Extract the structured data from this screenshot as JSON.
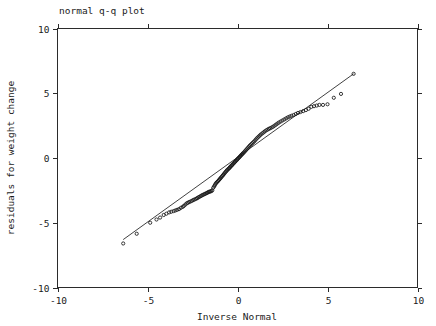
{
  "chart_data": {
    "type": "scatter",
    "title": "normal q-q plot",
    "xlabel": "Inverse Normal",
    "ylabel": "residuals for weight change",
    "xlim": [
      -10,
      10
    ],
    "ylim": [
      -10,
      10
    ],
    "xticks": [
      -10,
      -5,
      0,
      5,
      10
    ],
    "yticks": [
      -10,
      -5,
      0,
      5,
      10
    ],
    "xtick_labels": [
      "-10",
      "-5",
      "0",
      "5",
      "10"
    ],
    "ytick_labels": [
      "-10",
      "-5",
      "0",
      "5",
      "10"
    ],
    "grid": false,
    "legend": "none",
    "marker": "open-circle",
    "series": [
      {
        "name": "reference-line",
        "type": "line",
        "x": [
          -6.35,
          6.45
        ],
        "y": [
          -6.3,
          6.5
        ]
      },
      {
        "name": "residual-quantiles",
        "type": "scatter",
        "points": [
          [
            -6.35,
            -6.6
          ],
          [
            -5.6,
            -5.85
          ],
          [
            -4.85,
            -5.0
          ],
          [
            -4.5,
            -4.75
          ],
          [
            -4.3,
            -4.6
          ],
          [
            -4.1,
            -4.4
          ],
          [
            -3.95,
            -4.3
          ],
          [
            -3.8,
            -4.2
          ],
          [
            -3.68,
            -4.15
          ],
          [
            -3.55,
            -4.1
          ],
          [
            -3.45,
            -4.05
          ],
          [
            -3.35,
            -4.0
          ],
          [
            -3.25,
            -3.95
          ],
          [
            -3.15,
            -3.85
          ],
          [
            -3.05,
            -3.78
          ],
          [
            -2.98,
            -3.7
          ],
          [
            -2.9,
            -3.6
          ],
          [
            -2.82,
            -3.5
          ],
          [
            -2.75,
            -3.45
          ],
          [
            -2.68,
            -3.4
          ],
          [
            -2.6,
            -3.35
          ],
          [
            -2.52,
            -3.3
          ],
          [
            -2.45,
            -3.24
          ],
          [
            -2.38,
            -3.2
          ],
          [
            -2.3,
            -3.15
          ],
          [
            -2.24,
            -3.1
          ],
          [
            -2.18,
            -3.05
          ],
          [
            -2.12,
            -3.0
          ],
          [
            -2.05,
            -2.95
          ],
          [
            -2.0,
            -2.9
          ],
          [
            -1.94,
            -2.86
          ],
          [
            -1.88,
            -2.82
          ],
          [
            -1.82,
            -2.78
          ],
          [
            -1.76,
            -2.74
          ],
          [
            -1.7,
            -2.7
          ],
          [
            -1.65,
            -2.66
          ],
          [
            -1.6,
            -2.62
          ],
          [
            -1.55,
            -2.6
          ],
          [
            -1.5,
            -2.58
          ],
          [
            -1.45,
            -2.55
          ],
          [
            -1.4,
            -2.5
          ],
          [
            -1.35,
            -2.3
          ],
          [
            -1.3,
            -2.2
          ],
          [
            -1.26,
            -2.1
          ],
          [
            -1.22,
            -2.0
          ],
          [
            -1.18,
            -1.92
          ],
          [
            -1.13,
            -1.85
          ],
          [
            -1.08,
            -1.78
          ],
          [
            -1.03,
            -1.7
          ],
          [
            -0.98,
            -1.62
          ],
          [
            -0.94,
            -1.55
          ],
          [
            -0.9,
            -1.48
          ],
          [
            -0.85,
            -1.4
          ],
          [
            -0.8,
            -1.32
          ],
          [
            -0.76,
            -1.25
          ],
          [
            -0.72,
            -1.18
          ],
          [
            -0.68,
            -1.1
          ],
          [
            -0.63,
            -1.03
          ],
          [
            -0.59,
            -0.96
          ],
          [
            -0.55,
            -0.9
          ],
          [
            -0.5,
            -0.84
          ],
          [
            -0.46,
            -0.78
          ],
          [
            -0.42,
            -0.72
          ],
          [
            -0.38,
            -0.66
          ],
          [
            -0.34,
            -0.6
          ],
          [
            -0.3,
            -0.54
          ],
          [
            -0.26,
            -0.48
          ],
          [
            -0.22,
            -0.42
          ],
          [
            -0.18,
            -0.36
          ],
          [
            -0.14,
            -0.3
          ],
          [
            -0.1,
            -0.24
          ],
          [
            -0.06,
            -0.18
          ],
          [
            -0.02,
            -0.12
          ],
          [
            0.02,
            -0.06
          ],
          [
            0.06,
            0.0
          ],
          [
            0.1,
            0.06
          ],
          [
            0.14,
            0.12
          ],
          [
            0.18,
            0.18
          ],
          [
            0.22,
            0.24
          ],
          [
            0.26,
            0.3
          ],
          [
            0.3,
            0.36
          ],
          [
            0.35,
            0.42
          ],
          [
            0.4,
            0.5
          ],
          [
            0.45,
            0.58
          ],
          [
            0.5,
            0.66
          ],
          [
            0.55,
            0.74
          ],
          [
            0.6,
            0.82
          ],
          [
            0.65,
            0.9
          ],
          [
            0.7,
            0.98
          ],
          [
            0.76,
            1.06
          ],
          [
            0.82,
            1.14
          ],
          [
            0.88,
            1.22
          ],
          [
            0.94,
            1.3
          ],
          [
            1.0,
            1.4
          ],
          [
            1.06,
            1.5
          ],
          [
            1.12,
            1.58
          ],
          [
            1.18,
            1.66
          ],
          [
            1.24,
            1.74
          ],
          [
            1.3,
            1.82
          ],
          [
            1.38,
            1.9
          ],
          [
            1.45,
            1.98
          ],
          [
            1.52,
            2.06
          ],
          [
            1.6,
            2.14
          ],
          [
            1.68,
            2.2
          ],
          [
            1.75,
            2.26
          ],
          [
            1.82,
            2.3
          ],
          [
            1.9,
            2.36
          ],
          [
            1.98,
            2.42
          ],
          [
            2.06,
            2.5
          ],
          [
            2.14,
            2.58
          ],
          [
            2.22,
            2.66
          ],
          [
            2.3,
            2.74
          ],
          [
            2.4,
            2.82
          ],
          [
            2.5,
            2.9
          ],
          [
            2.6,
            2.98
          ],
          [
            2.7,
            3.06
          ],
          [
            2.8,
            3.14
          ],
          [
            2.9,
            3.2
          ],
          [
            3.0,
            3.26
          ],
          [
            3.12,
            3.32
          ],
          [
            3.24,
            3.4
          ],
          [
            3.36,
            3.48
          ],
          [
            3.5,
            3.55
          ],
          [
            3.65,
            3.62
          ],
          [
            3.8,
            3.7
          ],
          [
            3.95,
            3.8
          ],
          [
            4.1,
            3.95
          ],
          [
            4.25,
            4.0
          ],
          [
            4.4,
            4.05
          ],
          [
            4.55,
            4.1
          ],
          [
            4.75,
            4.1
          ],
          [
            5.0,
            4.15
          ],
          [
            5.35,
            4.65
          ],
          [
            5.75,
            4.95
          ],
          [
            6.45,
            6.5
          ]
        ]
      }
    ]
  }
}
